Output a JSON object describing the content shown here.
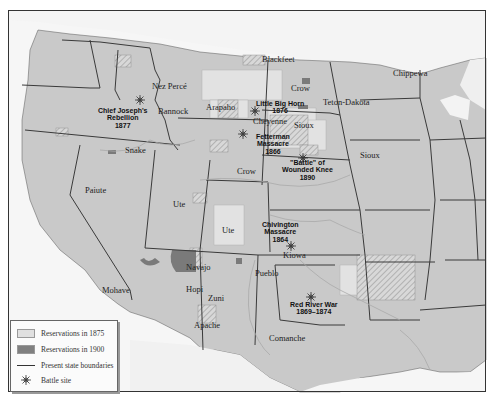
{
  "legend": {
    "items": [
      {
        "label": "Reservations in 1875",
        "color": "#e0e0e0"
      },
      {
        "label": "Reservations in 1900",
        "color": "#808080"
      },
      {
        "label": "Present state boundaries"
      },
      {
        "label": "Battle site"
      }
    ]
  },
  "tribes": [
    {
      "name": "Blackfeet",
      "x": 262,
      "y": 55
    },
    {
      "name": "Nez Percé",
      "x": 152,
      "y": 82
    },
    {
      "name": "Chippewa",
      "x": 393,
      "y": 69
    },
    {
      "name": "Crow",
      "x": 291,
      "y": 84
    },
    {
      "name": "Teton-Dakota",
      "x": 323,
      "y": 98
    },
    {
      "name": "Arapaho",
      "x": 206,
      "y": 103
    },
    {
      "name": "Bannock",
      "x": 158,
      "y": 107
    },
    {
      "name": "Cheyenne",
      "x": 253,
      "y": 117
    },
    {
      "name": "Sioux",
      "x": 294,
      "y": 121
    },
    {
      "name": "Sioux",
      "x": 360,
      "y": 151
    },
    {
      "name": "Snake",
      "x": 125,
      "y": 146
    },
    {
      "name": "Crow",
      "x": 237,
      "y": 167
    },
    {
      "name": "Paiute",
      "x": 85,
      "y": 186
    },
    {
      "name": "Ute",
      "x": 173,
      "y": 200
    },
    {
      "name": "Ute",
      "x": 222,
      "y": 226
    },
    {
      "name": "Kiowa",
      "x": 283,
      "y": 251
    },
    {
      "name": "Navajo",
      "x": 186,
      "y": 263
    },
    {
      "name": "Pueblo",
      "x": 255,
      "y": 269
    },
    {
      "name": "Hopi",
      "x": 186,
      "y": 285
    },
    {
      "name": "Zuni",
      "x": 208,
      "y": 294
    },
    {
      "name": "Mohave",
      "x": 102,
      "y": 286
    },
    {
      "name": "Apache",
      "x": 194,
      "y": 321
    },
    {
      "name": "Comanche",
      "x": 269,
      "y": 334
    }
  ],
  "battles": [
    {
      "name": "Chief Joseph's\nRebellion\n1877",
      "x": 98,
      "y": 107,
      "sx": 140,
      "sy": 96
    },
    {
      "name": "Little Big Horn\n1876",
      "x": 256,
      "y": 100,
      "sx": 255,
      "sy": 107
    },
    {
      "name": "Fetterman\nMassacre\n1866",
      "x": 256,
      "y": 133,
      "sx": 243,
      "sy": 130
    },
    {
      "name": "\"Battle\" of\nWounded Knee\n1890",
      "x": 282,
      "y": 159,
      "sx": 303,
      "sy": 154
    },
    {
      "name": "Chivington\nMassacre\n1864",
      "x": 262,
      "y": 221,
      "sx": 291,
      "sy": 242
    },
    {
      "name": "Red River War\n1869–1874",
      "x": 290,
      "y": 301,
      "sx": 311,
      "sy": 293
    }
  ]
}
